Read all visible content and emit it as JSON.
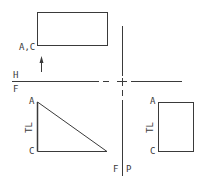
{
  "diagram": {
    "type": "orthographic-projection",
    "fold_lines": {
      "horizontal": {
        "upper_label": "H",
        "lower_label": "F"
      },
      "vertical": {
        "left_label": "F",
        "right_label": "P"
      }
    },
    "views": {
      "top": {
        "name": "horizontal-view",
        "point_label": "A,C"
      },
      "front": {
        "name": "front-view",
        "top_label": "A",
        "bottom_label": "C",
        "edge_label": "TL"
      },
      "profile": {
        "name": "profile-view",
        "top_label": "A",
        "bottom_label": "C",
        "edge_label": "TL"
      }
    },
    "arrow": {
      "direction": "up"
    },
    "colors": {
      "line": "#3a3a3a",
      "background": "#ffffff"
    }
  }
}
